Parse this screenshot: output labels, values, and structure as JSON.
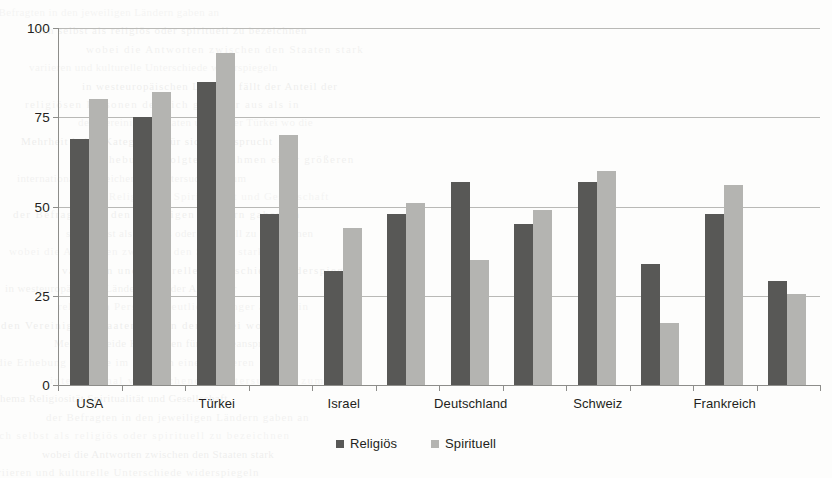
{
  "chart_data": {
    "type": "bar",
    "title": "",
    "subtitle": "",
    "xlabel": "",
    "ylabel": "",
    "ylim": [
      0,
      100
    ],
    "yticks": [
      0,
      25,
      50,
      75,
      100
    ],
    "ytick_labels": [
      "0",
      "25",
      "50",
      "75",
      "100"
    ],
    "grid": true,
    "legend_position": "bottom",
    "categories": [
      "USA",
      "",
      "Türkei",
      "",
      "Israel",
      "",
      "Deutschland",
      "",
      "Schweiz",
      "",
      "Frankreich",
      ""
    ],
    "visible_tick_labels": [
      "USA",
      "Türkei",
      "Israel",
      "Deutschland",
      "Schweiz",
      "Frankreich"
    ],
    "series": [
      {
        "name": "Religiös",
        "color": "#585856",
        "values": [
          69,
          75,
          85,
          48,
          32,
          48,
          57,
          45,
          57,
          34,
          48,
          29
        ]
      },
      {
        "name": "Spirituell",
        "color": "#b4b4b1",
        "values": [
          80,
          82,
          93,
          70,
          44,
          51,
          35,
          49,
          60,
          17.5,
          56,
          25.5
        ]
      }
    ]
  },
  "legend": {
    "items": [
      {
        "label": "Religiös",
        "swatch": "series-0-swatch"
      },
      {
        "label": "Spirituell",
        "swatch": "series-1-swatch"
      }
    ]
  },
  "background_artifacts": {
    "description": "faint bleed-through text from reverse side of scanned page",
    "lines": [
      "der Befragten in den jeweiligen Ländern gaben an",
      "sich selbst als religiös oder spirituell zu bezeichnen",
      "wobei die Antworten zwischen den Staaten stark",
      "variieren und kulturelle Unterschiede widerspiegeln",
      "in westeuropäischen Ländern fällt der Anteil der",
      "religiösen Personen deutlich geringer aus als in",
      "den Vereinigten Staaten und in der Türkei wo die",
      "Mehrheit beide Kategorien für sich beansprucht",
      "die Erhebung erfolgte im Rahmen einer größeren",
      "international vergleichenden Untersuchung zum",
      "Thema Religiosität Spiritualität und Gesellschaft"
    ]
  }
}
